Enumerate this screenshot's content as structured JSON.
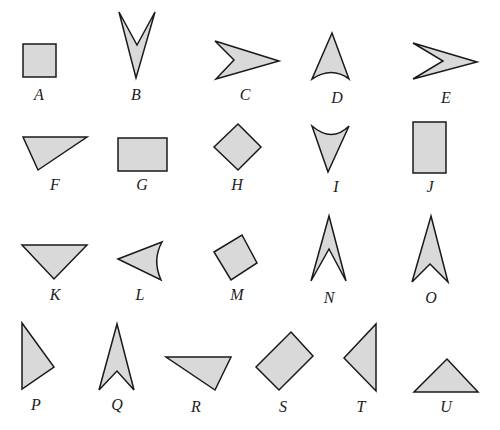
{
  "figure": {
    "fill_color": "#d9d9d9",
    "stroke_color": "#1a1a1a",
    "shapes": [
      {
        "label": "A",
        "kind": "square",
        "points": "23,44 56,44 56,77 23,77",
        "lx": 39,
        "ly": 100
      },
      {
        "label": "B",
        "kind": "concave-kite",
        "points": "119,12 137,45 155,12 136,78",
        "lx": 136,
        "ly": 100
      },
      {
        "label": "C",
        "kind": "concave-kite",
        "points": "215,41 279,61 216,79 234,60",
        "lx": 245,
        "ly": 100
      },
      {
        "label": "D",
        "kind": "curved-base-triangle",
        "path": "M332,33 L349,79 Q332,66 312,79 Z",
        "lx": 337,
        "ly": 103
      },
      {
        "label": "E",
        "kind": "concave-kite",
        "points": "413,43 477,62 413,79 443,61",
        "lx": 446,
        "ly": 103
      },
      {
        "label": "F",
        "kind": "triangle",
        "points": "23,137 87,137 38,170",
        "lx": 55,
        "ly": 190
      },
      {
        "label": "G",
        "kind": "rectangle",
        "points": "118,138 167,138 167,171 118,171",
        "lx": 142,
        "ly": 190
      },
      {
        "label": "H",
        "kind": "square-rotated",
        "points": "238,124 261,147 238,170 214,147",
        "lx": 237,
        "ly": 190
      },
      {
        "label": "I",
        "kind": "curved-top-triangle",
        "path": "M312,126 Q332,143 349,126 L328,172 Z",
        "lx": 336,
        "ly": 192
      },
      {
        "label": "J",
        "kind": "rectangle",
        "points": "413,122 446,122 446,173 413,173",
        "lx": 430,
        "ly": 192
      },
      {
        "label": "K",
        "kind": "triangle",
        "points": "22,245 87,245 54,279",
        "lx": 55,
        "ly": 300
      },
      {
        "label": "L",
        "kind": "curved-triangle",
        "path": "M118,259 L162,242 Q152,260 161,280 Z",
        "lx": 140,
        "ly": 300
      },
      {
        "label": "M",
        "kind": "square-rotated",
        "points": "214,252 242,235 257,263 231,280",
        "lx": 237,
        "ly": 300
      },
      {
        "label": "N",
        "kind": "concave-kite",
        "points": "329,216 346,281 329,249 311,281",
        "lx": 329,
        "ly": 303
      },
      {
        "label": "O",
        "kind": "concave-kite",
        "points": "431,216 448,282 430,264 412,282",
        "lx": 431,
        "ly": 303
      },
      {
        "label": "P",
        "kind": "triangle",
        "points": "22,323 54,367 22,389",
        "lx": 36,
        "ly": 410
      },
      {
        "label": "Q",
        "kind": "concave-kite",
        "points": "117,324 134,390 117,371 99,390",
        "lx": 117,
        "ly": 410
      },
      {
        "label": "R",
        "kind": "triangle",
        "points": "166,357 231,357 215,390",
        "lx": 196,
        "ly": 412
      },
      {
        "label": "S",
        "kind": "rectangle-rotated",
        "points": "291,332 313,356 279,390 256,367",
        "lx": 283,
        "ly": 412
      },
      {
        "label": "T",
        "kind": "triangle",
        "points": "376,324 376,391 344,358",
        "lx": 361,
        "ly": 412
      },
      {
        "label": "U",
        "kind": "triangle",
        "points": "447,359 478,392 414,392",
        "lx": 446,
        "ly": 412
      }
    ]
  }
}
